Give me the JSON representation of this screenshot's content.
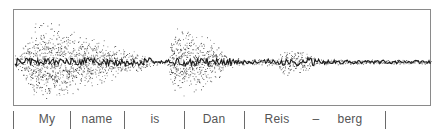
{
  "figure": {
    "ink_color": "#1a1a1a",
    "frame_color": "#8a8a8a"
  },
  "chart_data": {
    "type": "waveform",
    "title": "",
    "segments": [
      {
        "label": "My",
        "start": 0.0,
        "end": 0.136,
        "amplitude": 0.9
      },
      {
        "label": "name",
        "start": 0.136,
        "end": 0.266,
        "amplitude": 0.6
      },
      {
        "label": "is",
        "start": 0.266,
        "end": 0.409,
        "amplitude": 0.35
      },
      {
        "label": "Dan",
        "start": 0.409,
        "end": 0.553,
        "amplitude": 0.45
      },
      {
        "label": "Reis",
        "start": 0.553,
        "end": 0.65,
        "amplitude": 0.1
      },
      {
        "label": "–",
        "start": 0.65,
        "end": 0.72,
        "amplitude": 0.35
      },
      {
        "label": "berg",
        "start": 0.72,
        "end": 0.89,
        "amplitude": 0.08
      }
    ],
    "envelope": [
      [
        0.0,
        0.12
      ],
      [
        0.02,
        0.35
      ],
      [
        0.05,
        0.85
      ],
      [
        0.08,
        0.9
      ],
      [
        0.12,
        0.8
      ],
      [
        0.16,
        0.65
      ],
      [
        0.2,
        0.55
      ],
      [
        0.24,
        0.4
      ],
      [
        0.28,
        0.3
      ],
      [
        0.31,
        0.22
      ],
      [
        0.33,
        0.1
      ],
      [
        0.355,
        0.04
      ],
      [
        0.365,
        0.05
      ],
      [
        0.37,
        0.12
      ],
      [
        0.375,
        0.72
      ],
      [
        0.4,
        0.8
      ],
      [
        0.43,
        0.65
      ],
      [
        0.47,
        0.55
      ],
      [
        0.49,
        0.4
      ],
      [
        0.51,
        0.18
      ],
      [
        0.53,
        0.1
      ],
      [
        0.55,
        0.08
      ],
      [
        0.58,
        0.06
      ],
      [
        0.6,
        0.1
      ],
      [
        0.62,
        0.07
      ],
      [
        0.63,
        0.08
      ],
      [
        0.645,
        0.35
      ],
      [
        0.67,
        0.35
      ],
      [
        0.7,
        0.25
      ],
      [
        0.72,
        0.1
      ],
      [
        0.75,
        0.06
      ],
      [
        0.8,
        0.06
      ],
      [
        0.85,
        0.05
      ],
      [
        0.9,
        0.06
      ],
      [
        0.95,
        0.05
      ],
      [
        1.0,
        0.05
      ]
    ]
  },
  "labels": {
    "words": [
      "My",
      "name",
      "is",
      "Dan",
      "Reis",
      "–",
      "berg"
    ]
  }
}
